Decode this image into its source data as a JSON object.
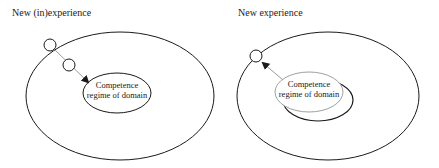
{
  "panels": [
    {
      "title": "New (in)experience",
      "inner_label_line1": "Competence",
      "inner_label_line2": "regime of domain",
      "arrow_direction": "inward"
    },
    {
      "title": "New experience",
      "inner_label_line1": "Competence",
      "inner_label_line2": "regime of domain",
      "arrow_direction": "outward"
    }
  ],
  "colors": {
    "stroke": "#1a1a1a",
    "arrow_line": "#9a9a9a",
    "shifted_regime": "#a0a0a0"
  }
}
